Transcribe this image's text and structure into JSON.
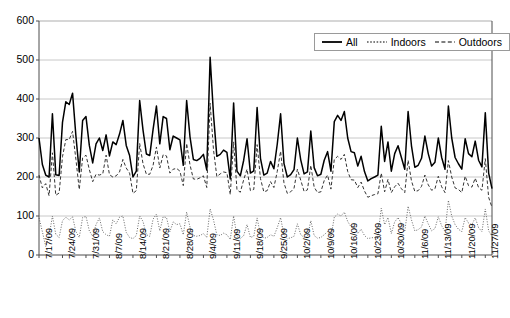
{
  "chart_data": {
    "type": "line",
    "title": "",
    "xlabel": "",
    "ylabel": "",
    "ylim": [
      0,
      600
    ],
    "ytick_step": 100,
    "ytick_labels": [
      "0",
      "100",
      "200",
      "300",
      "400",
      "500",
      "600"
    ],
    "grid": "horizontal",
    "legend_position": "top-right",
    "x_tick_labels": [
      "7/17/09",
      "7/24/09",
      "7/31/09",
      "8/7/09",
      "8/14/09",
      "8/21/09",
      "8/28/09",
      "9/4/09",
      "9/11/09",
      "9/18/09",
      "9/25/09",
      "10/2/09",
      "10/9/09",
      "10/16/09",
      "10/23/09",
      "10/30/09",
      "11/6/09",
      "11/13/09",
      "11/20/09",
      "11/27/09"
    ],
    "x_tick_interval_days": 7,
    "x_start": "7/17/09",
    "x_end": "11/27/09",
    "series": [
      {
        "name": "All",
        "style": "solid",
        "color": "#000000",
        "values": [
          300,
          232,
          205,
          200,
          362,
          206,
          204,
          340,
          393,
          386,
          415,
          305,
          213,
          345,
          355,
          281,
          236,
          285,
          300,
          268,
          308,
          254,
          290,
          283,
          310,
          345,
          281,
          255,
          200,
          215,
          396,
          320,
          259,
          255,
          322,
          382,
          285,
          355,
          350,
          270,
          305,
          300,
          295,
          230,
          396,
          303,
          245,
          242,
          248,
          258,
          218,
          507,
          360,
          253,
          258,
          269,
          263,
          195,
          390,
          215,
          203,
          243,
          298,
          210,
          216,
          378,
          248,
          205,
          210,
          240,
          221,
          284,
          362,
          235,
          200,
          206,
          219,
          300,
          244,
          208,
          213,
          318,
          224,
          203,
          207,
          243,
          265,
          215,
          342,
          358,
          345,
          368,
          300,
          265,
          262,
          228,
          253,
          214,
          190,
          196,
          200,
          205,
          330,
          240,
          290,
          215,
          260,
          280,
          250,
          220,
          368,
          280,
          225,
          230,
          248,
          305,
          260,
          228,
          238,
          300,
          250,
          220,
          382,
          300,
          250,
          234,
          220,
          298,
          260,
          252,
          292,
          243,
          226,
          365,
          210,
          170
        ]
      },
      {
        "name": "Indoors",
        "style": "dotted",
        "color": "#555555",
        "values": [
          95,
          60,
          22,
          48,
          100,
          53,
          45,
          88,
          97,
          90,
          98,
          60,
          45,
          96,
          99,
          62,
          48,
          78,
          95,
          60,
          52,
          48,
          90,
          80,
          97,
          100,
          58,
          45,
          42,
          50,
          100,
          86,
          52,
          48,
          92,
          105,
          62,
          98,
          96,
          60,
          85,
          78,
          80,
          52,
          110,
          72,
          50,
          48,
          50,
          55,
          45,
          118,
          90,
          52,
          50,
          56,
          52,
          40,
          100,
          48,
          42,
          50,
          78,
          45,
          48,
          95,
          52,
          43,
          45,
          52,
          48,
          70,
          96,
          50,
          42,
          44,
          48,
          80,
          52,
          45,
          46,
          88,
          50,
          43,
          45,
          52,
          60,
          46,
          97,
          105,
          100,
          110,
          86,
          72,
          70,
          55,
          66,
          50,
          42,
          44,
          45,
          48,
          120,
          78,
          96,
          55,
          85,
          96,
          80,
          60,
          125,
          90,
          62,
          65,
          72,
          100,
          80,
          62,
          68,
          98,
          75,
          60,
          140,
          100,
          78,
          66,
          60,
          96,
          82,
          78,
          95,
          70,
          60,
          118,
          62,
          48
        ]
      },
      {
        "name": "Outdoors",
        "style": "dashed",
        "color": "#333333",
        "values": [
          205,
          172,
          183,
          152,
          262,
          153,
          159,
          252,
          296,
          296,
          317,
          245,
          168,
          249,
          256,
          219,
          188,
          207,
          205,
          208,
          256,
          206,
          200,
          203,
          213,
          245,
          223,
          210,
          158,
          165,
          286,
          234,
          207,
          207,
          230,
          277,
          223,
          257,
          254,
          210,
          220,
          222,
          215,
          178,
          286,
          231,
          195,
          194,
          198,
          203,
          173,
          389,
          270,
          201,
          208,
          213,
          211,
          155,
          290,
          167,
          161,
          193,
          220,
          165,
          168,
          283,
          196,
          162,
          165,
          188,
          173,
          214,
          266,
          185,
          158,
          162,
          171,
          220,
          192,
          163,
          167,
          230,
          174,
          160,
          162,
          191,
          205,
          169,
          245,
          253,
          245,
          258,
          214,
          193,
          192,
          173,
          187,
          164,
          148,
          152,
          155,
          157,
          210,
          162,
          194,
          160,
          175,
          184,
          170,
          160,
          243,
          190,
          163,
          165,
          176,
          205,
          180,
          166,
          170,
          202,
          175,
          160,
          242,
          200,
          172,
          168,
          160,
          202,
          178,
          174,
          197,
          173,
          166,
          247,
          148,
          122
        ]
      }
    ]
  },
  "legend": {
    "entries": [
      {
        "label": "All",
        "style": "solid"
      },
      {
        "label": "Indoors",
        "style": "dotted"
      },
      {
        "label": "Outdoors",
        "style": "dashed"
      }
    ]
  }
}
